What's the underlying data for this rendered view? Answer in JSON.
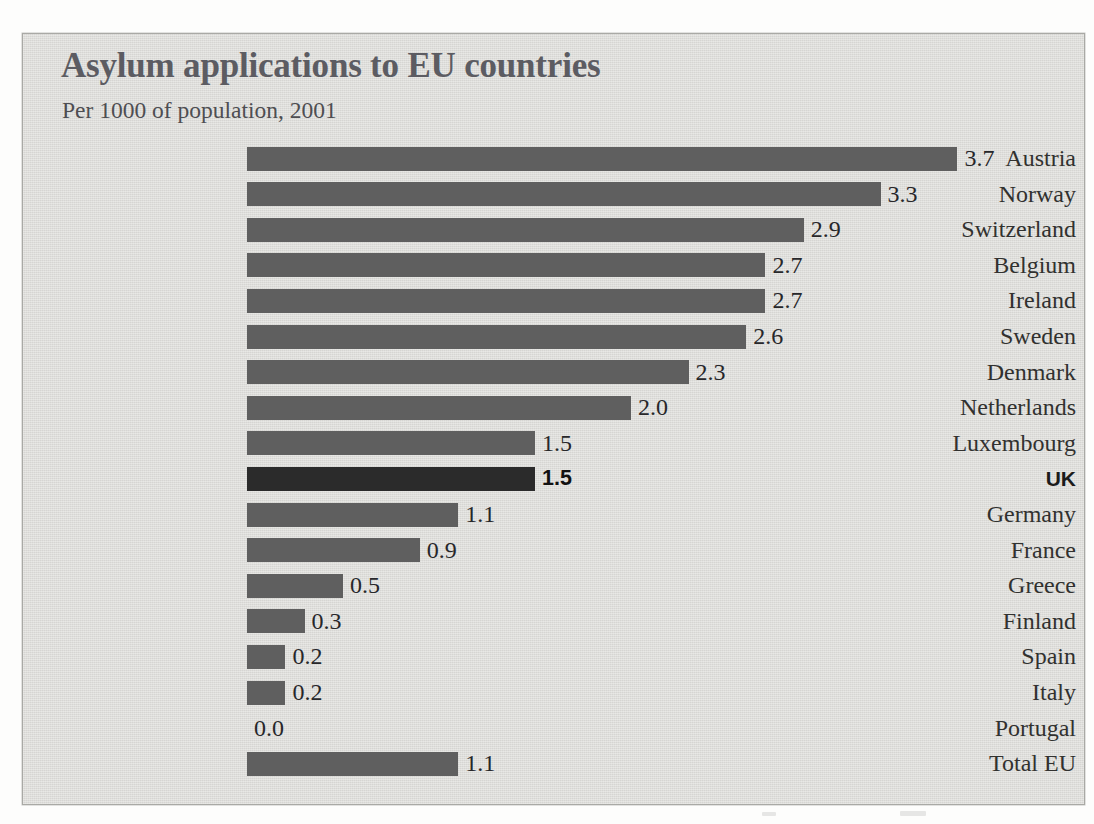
{
  "chart": {
    "title": "Asylum applications to EU countries",
    "subtitle": "Per 1000 of population, 2001"
  },
  "colors": {
    "panel_background": "#dddcd9",
    "panel_border": "#a9a9a5",
    "title_text": "#5c5c62",
    "bar_default": "#5f5f5f",
    "bar_highlight": "#2b2b2b",
    "label_text": "#31312f"
  },
  "chart_data": {
    "type": "bar",
    "orientation": "horizontal",
    "title": "Asylum applications to EU countries",
    "subtitle": "Per 1000 of population, 2001",
    "xlabel": "",
    "ylabel": "",
    "unit": "applications per 1000 of population",
    "year": 2001,
    "xlim": [
      0,
      4.0
    ],
    "grid": false,
    "legend": false,
    "highlight_category": "UK",
    "categories": [
      "Austria",
      "Norway",
      "Switzerland",
      "Belgium",
      "Ireland",
      "Sweden",
      "Denmark",
      "Netherlands",
      "Luxembourg",
      "UK",
      "Germany",
      "France",
      "Greece",
      "Finland",
      "Spain",
      "Italy",
      "Portugal",
      "Total EU"
    ],
    "values": [
      3.7,
      3.3,
      2.9,
      2.7,
      2.7,
      2.6,
      2.3,
      2.0,
      1.5,
      1.5,
      1.1,
      0.9,
      0.5,
      0.3,
      0.2,
      0.2,
      0.0,
      1.1
    ],
    "labels": [
      "3.7",
      "3.3",
      "2.9",
      "2.7",
      "2.7",
      "2.6",
      "2.3",
      "2.0",
      "1.5",
      "1.5",
      "1.1",
      "0.9",
      "0.5",
      "0.3",
      "0.2",
      "0.2",
      "0.0",
      "1.1"
    ],
    "rows": [
      {
        "label": "Austria",
        "value": 3.7,
        "display": "3.7",
        "highlight": false
      },
      {
        "label": "Norway",
        "value": 3.3,
        "display": "3.3",
        "highlight": false
      },
      {
        "label": "Switzerland",
        "value": 2.9,
        "display": "2.9",
        "highlight": false
      },
      {
        "label": "Belgium",
        "value": 2.7,
        "display": "2.7",
        "highlight": false
      },
      {
        "label": "Ireland",
        "value": 2.7,
        "display": "2.7",
        "highlight": false
      },
      {
        "label": "Sweden",
        "value": 2.6,
        "display": "2.6",
        "highlight": false
      },
      {
        "label": "Denmark",
        "value": 2.3,
        "display": "2.3",
        "highlight": false
      },
      {
        "label": "Netherlands",
        "value": 2.0,
        "display": "2.0",
        "highlight": false
      },
      {
        "label": "Luxembourg",
        "value": 1.5,
        "display": "1.5",
        "highlight": false
      },
      {
        "label": "UK",
        "value": 1.5,
        "display": "1.5",
        "highlight": true
      },
      {
        "label": "Germany",
        "value": 1.1,
        "display": "1.1",
        "highlight": false
      },
      {
        "label": "France",
        "value": 0.9,
        "display": "0.9",
        "highlight": false
      },
      {
        "label": "Greece",
        "value": 0.5,
        "display": "0.5",
        "highlight": false
      },
      {
        "label": "Finland",
        "value": 0.3,
        "display": "0.3",
        "highlight": false
      },
      {
        "label": "Spain",
        "value": 0.2,
        "display": "0.2",
        "highlight": false
      },
      {
        "label": "Italy",
        "value": 0.2,
        "display": "0.2",
        "highlight": false
      },
      {
        "label": "Portugal",
        "value": 0.0,
        "display": "0.0",
        "highlight": false
      },
      {
        "label": "Total EU",
        "value": 1.1,
        "display": "1.1",
        "highlight": false
      }
    ]
  },
  "layout": {
    "row_pitch": 35.6,
    "px_per_unit": 192,
    "first_row_top": 6
  }
}
